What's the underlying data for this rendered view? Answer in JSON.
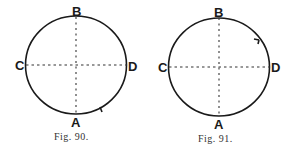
{
  "figures": [
    {
      "caption": "Fig. 90.",
      "labels": {
        "top": "B",
        "bottom": "A",
        "left": "C",
        "right": "D"
      },
      "tick_position": "lower-right, near A"
    },
    {
      "caption": "Fig. 91.",
      "labels": {
        "top": "B",
        "bottom": "A",
        "left": "C",
        "right": "D"
      },
      "tick_position": "upper-right, between B and D"
    }
  ]
}
